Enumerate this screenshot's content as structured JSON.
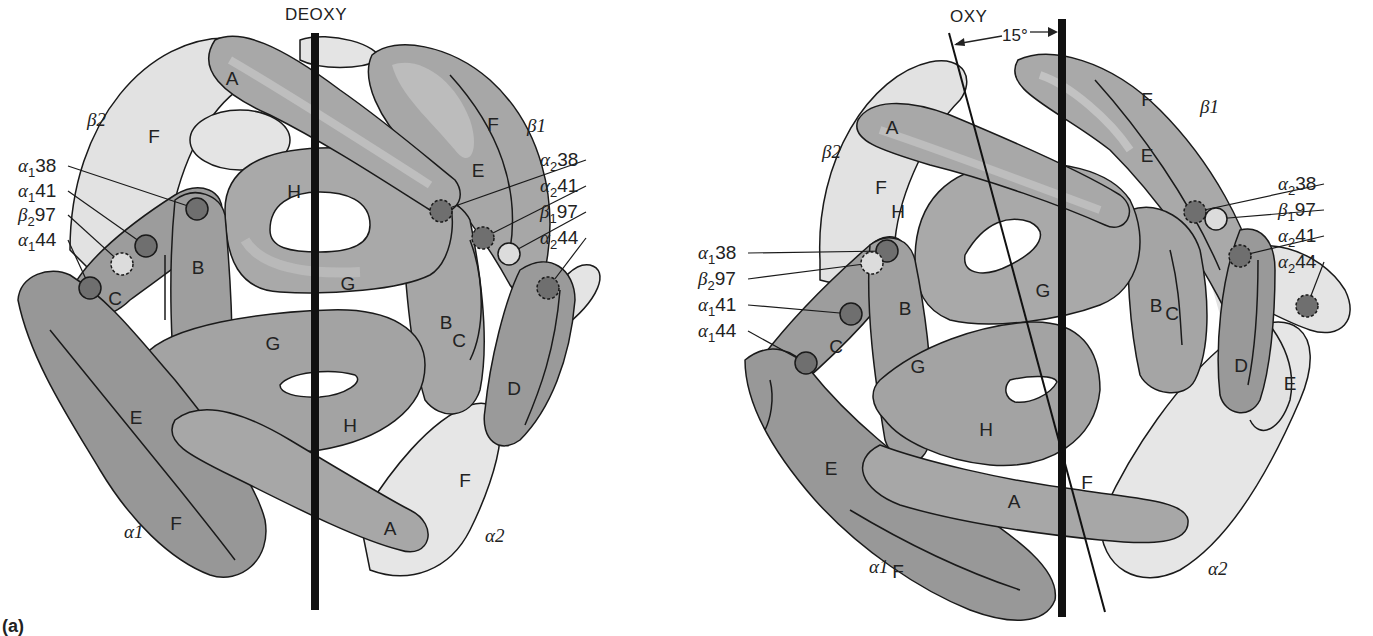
{
  "figure": {
    "panel_label": "(a)",
    "colors": {
      "alpha_dark": "#8c8c8c",
      "alpha_mid": "#a4a4a4",
      "alpha_highlight": "#b8b8b8",
      "beta_light": "#e2e2e2",
      "beta_mid": "#a8a8a8",
      "outline": "#1a1a1a",
      "axis": "#111111",
      "residue_dark": "#6f6f6f",
      "residue_light": "#dcdcdc",
      "background": "#ffffff"
    }
  },
  "deoxy": {
    "title": "DEOXY",
    "chains": {
      "beta2": "β2",
      "beta1": "β1",
      "alpha1": "α1",
      "alpha2": "α2"
    },
    "helices": [
      {
        "id": "A-top",
        "label": "A",
        "x": 232,
        "y": 85
      },
      {
        "id": "F-beta2",
        "label": "F",
        "x": 154,
        "y": 143
      },
      {
        "id": "H-top",
        "label": "H",
        "x": 294,
        "y": 198
      },
      {
        "id": "B-left",
        "label": "B",
        "x": 198,
        "y": 274
      },
      {
        "id": "C-left",
        "label": "C",
        "x": 115,
        "y": 305
      },
      {
        "id": "G-top",
        "label": "G",
        "x": 348,
        "y": 290
      },
      {
        "id": "F-beta1",
        "label": "F",
        "x": 493,
        "y": 131
      },
      {
        "id": "E-beta1",
        "label": "E",
        "x": 478,
        "y": 177
      },
      {
        "id": "B-right",
        "label": "B",
        "x": 446,
        "y": 329
      },
      {
        "id": "C-right",
        "label": "C",
        "x": 459,
        "y": 347
      },
      {
        "id": "D-right",
        "label": "D",
        "x": 514,
        "y": 395
      },
      {
        "id": "G-bottom",
        "label": "G",
        "x": 273,
        "y": 350
      },
      {
        "id": "H-bottom",
        "label": "H",
        "x": 350,
        "y": 432
      },
      {
        "id": "E-alpha1",
        "label": "E",
        "x": 136,
        "y": 424
      },
      {
        "id": "F-alpha1",
        "label": "F",
        "x": 176,
        "y": 530
      },
      {
        "id": "A-bottom",
        "label": "A",
        "x": 390,
        "y": 535
      },
      {
        "id": "F-alpha2",
        "label": "F",
        "x": 465,
        "y": 487
      }
    ],
    "residues_left": [
      {
        "label": "α138",
        "sub_base": "α",
        "sub": "1",
        "num": "38",
        "text_x": 18,
        "text_y": 172,
        "dot_x": 197,
        "dot_y": 209,
        "style": "dark"
      },
      {
        "label": "α141",
        "sub_base": "α",
        "sub": "1",
        "num": "41",
        "text_x": 18,
        "text_y": 197,
        "dot_x": 146,
        "dot_y": 246,
        "style": "dark"
      },
      {
        "label": "β297",
        "sub_base": "β",
        "sub": "2",
        "num": "97",
        "text_x": 18,
        "text_y": 221,
        "dot_x": 122,
        "dot_y": 264,
        "style": "dashed-light"
      },
      {
        "label": "α144",
        "sub_base": "α",
        "sub": "1",
        "num": "44",
        "text_x": 18,
        "text_y": 246,
        "dot_x": 90,
        "dot_y": 288,
        "style": "dark"
      }
    ],
    "residues_right": [
      {
        "label": "α238",
        "sub_base": "α",
        "sub": "2",
        "num": "38",
        "text_x": 590,
        "text_y": 166,
        "dot_x": 441,
        "dot_y": 211,
        "style": "dashed-dark"
      },
      {
        "label": "α241",
        "sub_base": "α",
        "sub": "2",
        "num": "41",
        "text_x": 590,
        "text_y": 192,
        "dot_x": 483,
        "dot_y": 238,
        "style": "dashed-dark"
      },
      {
        "label": "β197",
        "sub_base": "β",
        "sub": "1",
        "num": "97",
        "text_x": 590,
        "text_y": 218,
        "dot_x": 509,
        "dot_y": 254,
        "style": "light"
      },
      {
        "label": "α244",
        "sub_base": "α",
        "sub": "2",
        "num": "44",
        "text_x": 590,
        "text_y": 244,
        "dot_x": 548,
        "dot_y": 288,
        "style": "dashed-dark"
      }
    ]
  },
  "oxy": {
    "title": "OXY",
    "rotation_angle": "15°",
    "chains": {
      "beta2": "β2",
      "beta1": "β1",
      "alpha1": "α1",
      "alpha2": "α2"
    },
    "helices": [
      {
        "id": "A-top",
        "label": "A",
        "x": 892,
        "y": 134
      },
      {
        "id": "F-beta2",
        "label": "F",
        "x": 881,
        "y": 194
      },
      {
        "id": "H-top",
        "label": "H",
        "x": 898,
        "y": 218
      },
      {
        "id": "F-beta1",
        "label": "F",
        "x": 1147,
        "y": 106
      },
      {
        "id": "E-beta1",
        "label": "E",
        "x": 1147,
        "y": 162
      },
      {
        "id": "G-top",
        "label": "G",
        "x": 1043,
        "y": 297
      },
      {
        "id": "B-left",
        "label": "B",
        "x": 905,
        "y": 315
      },
      {
        "id": "C-left",
        "label": "C",
        "x": 836,
        "y": 353
      },
      {
        "id": "B-right",
        "label": "B",
        "x": 1156,
        "y": 312
      },
      {
        "id": "C-right",
        "label": "C",
        "x": 1172,
        "y": 320
      },
      {
        "id": "D-right",
        "label": "D",
        "x": 1241,
        "y": 372
      },
      {
        "id": "E-alpha2",
        "label": "E",
        "x": 1290,
        "y": 390
      },
      {
        "id": "G-bottom",
        "label": "G",
        "x": 918,
        "y": 373
      },
      {
        "id": "H-bottom",
        "label": "H",
        "x": 986,
        "y": 436
      },
      {
        "id": "E-alpha1",
        "label": "E",
        "x": 831,
        "y": 475
      },
      {
        "id": "A-bottom",
        "label": "A",
        "x": 1014,
        "y": 508
      },
      {
        "id": "F-alpha2",
        "label": "F",
        "x": 1087,
        "y": 489
      },
      {
        "id": "F-alpha1",
        "label": "F",
        "x": 898,
        "y": 578
      }
    ],
    "residues_left": [
      {
        "label": "α138",
        "sub_base": "α",
        "sub": "1",
        "num": "38",
        "text_x": 698,
        "text_y": 259,
        "dot_x": 887,
        "dot_y": 251,
        "style": "dark"
      },
      {
        "label": "β297",
        "sub_base": "β",
        "sub": "2",
        "num": "97",
        "text_x": 698,
        "text_y": 285,
        "dot_x": 872,
        "dot_y": 263,
        "style": "dashed-light"
      },
      {
        "label": "α141",
        "sub_base": "α",
        "sub": "1",
        "num": "41",
        "text_x": 698,
        "text_y": 311,
        "dot_x": 851,
        "dot_y": 314,
        "style": "dark"
      },
      {
        "label": "α144",
        "sub_base": "α",
        "sub": "1",
        "num": "44",
        "text_x": 698,
        "text_y": 337,
        "dot_x": 806,
        "dot_y": 363,
        "style": "dark"
      }
    ],
    "residues_right": [
      {
        "label": "α238",
        "sub_base": "α",
        "sub": "2",
        "num": "38",
        "text_x": 1328,
        "text_y": 190,
        "dot_x": 1195,
        "dot_y": 212,
        "style": "dashed-dark"
      },
      {
        "label": "β197",
        "sub_base": "β",
        "sub": "1",
        "num": "97",
        "text_x": 1328,
        "text_y": 216,
        "dot_x": 1216,
        "dot_y": 219,
        "style": "light"
      },
      {
        "label": "α241",
        "sub_base": "α",
        "sub": "2",
        "num": "41",
        "text_x": 1328,
        "text_y": 242,
        "dot_x": 1240,
        "dot_y": 256,
        "style": "dashed-dark"
      },
      {
        "label": "α244",
        "sub_base": "α",
        "sub": "2",
        "num": "44",
        "text_x": 1328,
        "text_y": 268,
        "dot_x": 1307,
        "dot_y": 306,
        "style": "dashed-dark"
      }
    ]
  }
}
